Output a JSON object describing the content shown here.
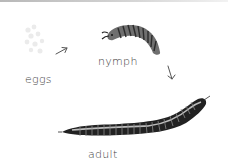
{
  "diagram": {
    "stages": [
      {
        "id": "eggs",
        "label": "eggs"
      },
      {
        "id": "nymph",
        "label": "nymph"
      },
      {
        "id": "adult",
        "label": "adult"
      }
    ],
    "arrows": [
      {
        "from": "eggs",
        "to": "nymph",
        "icon": "arrow-up-right-icon"
      },
      {
        "from": "nymph",
        "to": "adult",
        "icon": "arrow-down-icon"
      }
    ],
    "colors": {
      "text": "#444444",
      "body_dark": "#2a2a2a",
      "body_mid": "#7a7a7a",
      "eggs": "#ececec"
    }
  }
}
